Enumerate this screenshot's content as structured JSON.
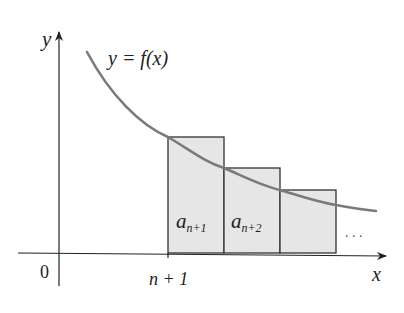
{
  "diagram": {
    "type": "integral-test-rectangles",
    "axes": {
      "x_label": "x",
      "y_label": "y",
      "origin_label": "0",
      "tick_label": "n + 1"
    },
    "curve": {
      "label": "y = f(x)",
      "color": "#7a7a7a"
    },
    "rectangles": [
      {
        "label_base": "a",
        "label_sub": "n+1",
        "fill": "#e6e6e6"
      },
      {
        "label_base": "a",
        "label_sub": "n+2",
        "fill": "#e6e6e6"
      },
      {
        "label_base": "",
        "label_sub": "",
        "fill": "#e6e6e6"
      }
    ],
    "ellipsis": ". . ."
  }
}
